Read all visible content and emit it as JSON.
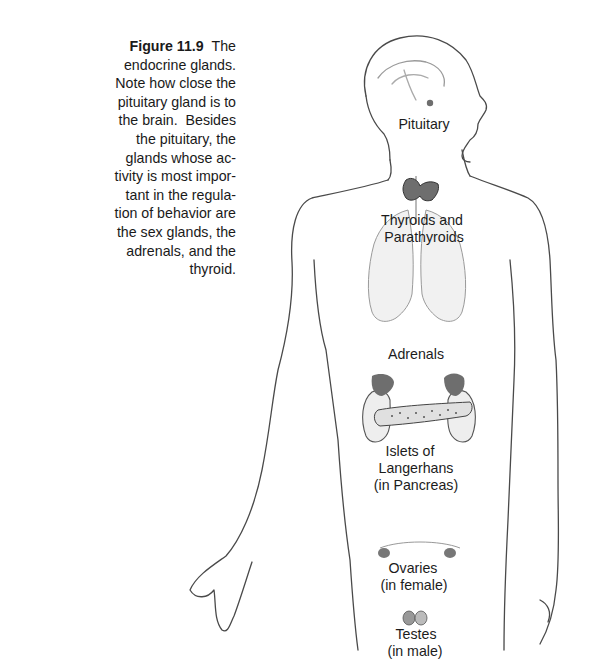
{
  "caption": {
    "figure_number": "Figure 11.9",
    "lines": [
      "The",
      "endocrine glands.",
      "Note how close the",
      "pituitary gland is to",
      "the brain.  Besides",
      "the pituitary, the",
      "glands whose ac-",
      "tivity is most impor-",
      "tant in the regula-",
      "tion of behavior are",
      "the sex glands, the",
      "adrenals, and the",
      "thyroid."
    ]
  },
  "figure": {
    "labels": {
      "pituitary": "Pituitary",
      "thyroids_1": "Thyroids and",
      "thyroids_2": "Parathyroids",
      "adrenals": "Adrenals",
      "islets_1": "Islets of",
      "islets_2": "Langerhans",
      "islets_3": "(in Pancreas)",
      "ovaries_1": "Ovaries",
      "ovaries_2": "(in female)",
      "testes_1": "Testes",
      "testes_2": "(in male)"
    },
    "colors": {
      "outline": "#3a3a3a",
      "gland_fill": "#6e6e6e",
      "organ_fill": "#e6e6e6"
    }
  }
}
